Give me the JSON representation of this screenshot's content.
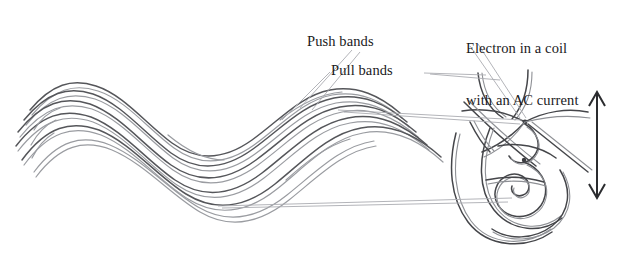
{
  "figure": {
    "width": 629,
    "height": 253,
    "background_color": "#ffffff"
  },
  "labels": {
    "push_bands": "Push bands",
    "pull_bands": "Pull bands",
    "coil_line1": "Electron in a coil",
    "coil_line2": "with an AC current"
  },
  "colors": {
    "band_dark": "#55565a",
    "band_light": "#9a9ca1",
    "coil_dark": "#45464a",
    "coil_light": "#8e9095",
    "leader": "#aaacb1",
    "arrow": "#2b2c2f",
    "text": "#1a1a1c"
  },
  "annotations": {
    "oscillation_arrow": "vertical-double-headed-arrow"
  }
}
